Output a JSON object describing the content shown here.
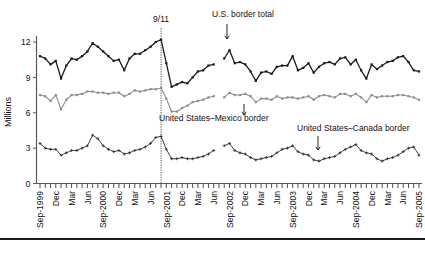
{
  "chart_data": {
    "type": "line",
    "title": "",
    "subtitle": "",
    "xlabel": "",
    "ylabel": "Millions",
    "ylim": [
      0,
      13
    ],
    "yticks": [
      0,
      3,
      6,
      9,
      12
    ],
    "ytick_labels": [
      "0",
      "3",
      "6",
      "9",
      "12"
    ],
    "grid": false,
    "legend_position": "inline-annotations",
    "x_start": "Sep-1999",
    "x_end": "Sep-2005",
    "x_interval": "monthly",
    "xtick_labels": [
      "Sep-1999",
      "Dec",
      "Mar",
      "Jun",
      "Sep-2000",
      "Dec",
      "Mar",
      "Jun",
      "Sep-2001",
      "Dec",
      "Mar",
      "Jun",
      "Sep-2002",
      "Dec",
      "Mar",
      "Jun",
      "Sep-2003",
      "Dec",
      "Mar",
      "Jun",
      "Sep-2004",
      "Dec",
      "Mar",
      "Jun",
      "Sep-2005"
    ],
    "x": [
      "Sep-1999",
      "Oct-1999",
      "Nov-1999",
      "Dec-1999",
      "Jan-2000",
      "Feb-2000",
      "Mar-2000",
      "Apr-2000",
      "May-2000",
      "Jun-2000",
      "Jul-2000",
      "Aug-2000",
      "Sep-2000",
      "Oct-2000",
      "Nov-2000",
      "Dec-2000",
      "Jan-2001",
      "Feb-2001",
      "Mar-2001",
      "Apr-2001",
      "May-2001",
      "Jun-2001",
      "Jul-2001",
      "Aug-2001",
      "Sep-2001",
      "Oct-2001",
      "Nov-2001",
      "Dec-2001",
      "Jan-2002",
      "Feb-2002",
      "Mar-2002",
      "Apr-2002",
      "May-2002",
      "Jun-2002",
      "Jul-2002",
      "Aug-2002",
      "Sep-2002",
      "Oct-2002",
      "Nov-2002",
      "Dec-2002",
      "Jan-2003",
      "Feb-2003",
      "Mar-2003",
      "Apr-2003",
      "May-2003",
      "Jun-2003",
      "Jul-2003",
      "Aug-2003",
      "Sep-2003",
      "Oct-2003",
      "Nov-2003",
      "Dec-2003",
      "Jan-2004",
      "Feb-2004",
      "Mar-2004",
      "Apr-2004",
      "May-2004",
      "Jun-2004",
      "Jul-2004",
      "Aug-2004",
      "Sep-2004",
      "Oct-2004",
      "Nov-2004",
      "Dec-2004",
      "Jan-2005",
      "Feb-2005",
      "Mar-2005",
      "Apr-2005",
      "May-2005",
      "Jun-2005",
      "Jul-2005",
      "Aug-2005",
      "Sep-2005"
    ],
    "series": [
      {
        "name": "U.S. border total",
        "color": "#1a1a1a",
        "marker": "square",
        "values": [
          10.8,
          10.6,
          10.1,
          10.4,
          8.9,
          10.0,
          10.6,
          10.5,
          10.8,
          11.2,
          11.9,
          11.6,
          11.2,
          10.8,
          10.4,
          10.5,
          9.6,
          10.6,
          11.0,
          11.0,
          11.3,
          11.6,
          12.0,
          12.2,
          10.2,
          8.2,
          8.4,
          8.6,
          8.5,
          9.0,
          9.5,
          9.6,
          10.0,
          10.1,
          null,
          10.6,
          11.3,
          10.2,
          10.3,
          10.1,
          9.5,
          8.7,
          9.4,
          9.5,
          9.3,
          9.9,
          10.0,
          10.0,
          10.8,
          9.6,
          9.8,
          10.2,
          9.4,
          9.9,
          10.2,
          10.3,
          10.1,
          10.6,
          10.7,
          10.1,
          10.5,
          9.6,
          8.9,
          10.1,
          9.7,
          10.0,
          10.3,
          10.4,
          10.7,
          10.8,
          10.3,
          9.6,
          9.5
        ]
      },
      {
        "name": "United States–Mexico border",
        "color": "#8d8d8d",
        "marker": "square",
        "values": [
          7.5,
          7.4,
          7.0,
          7.5,
          6.3,
          7.1,
          7.5,
          7.5,
          7.6,
          7.8,
          7.8,
          7.7,
          7.7,
          7.6,
          7.7,
          7.7,
          7.4,
          7.6,
          7.9,
          7.8,
          7.9,
          8.0,
          8.0,
          8.1,
          7.2,
          6.1,
          6.1,
          6.4,
          6.6,
          6.9,
          7.0,
          7.1,
          7.3,
          7.4,
          null,
          7.3,
          7.7,
          7.5,
          7.5,
          7.6,
          7.4,
          6.9,
          7.2,
          7.2,
          7.1,
          7.4,
          7.2,
          7.3,
          7.3,
          7.2,
          7.3,
          7.4,
          7.1,
          7.4,
          7.5,
          7.4,
          7.3,
          7.6,
          7.6,
          7.4,
          7.6,
          7.3,
          6.9,
          7.5,
          7.3,
          7.4,
          7.4,
          7.4,
          7.5,
          7.5,
          7.4,
          7.3,
          7.1
        ]
      },
      {
        "name": "United States–Canada border",
        "color": "#2b2b2b",
        "marker": "plus",
        "values": [
          3.4,
          3.0,
          2.9,
          2.9,
          2.4,
          2.6,
          2.8,
          2.8,
          3.0,
          3.2,
          4.1,
          3.8,
          3.2,
          2.9,
          2.7,
          2.8,
          2.5,
          2.6,
          2.8,
          2.9,
          3.1,
          3.4,
          3.9,
          4.0,
          2.9,
          2.1,
          2.1,
          2.2,
          2.1,
          2.1,
          2.2,
          2.3,
          2.5,
          2.8,
          null,
          3.2,
          3.4,
          2.8,
          2.6,
          2.5,
          2.2,
          2.0,
          2.1,
          2.2,
          2.3,
          2.6,
          2.9,
          3.0,
          3.2,
          2.7,
          2.5,
          2.4,
          2.0,
          1.9,
          2.1,
          2.2,
          2.3,
          2.6,
          2.9,
          3.1,
          3.3,
          2.8,
          2.6,
          2.5,
          2.1,
          1.9,
          2.1,
          2.2,
          2.4,
          2.7,
          3.0,
          3.1,
          2.4
        ]
      }
    ],
    "annotations": [
      {
        "name": "event-911",
        "label": "9/11",
        "x": "Aug-2001",
        "type": "vertical-dotted-line"
      },
      {
        "name": "annot-total",
        "label": "U.S. border total",
        "x": "Sep-2002",
        "y": 11.3,
        "type": "arrow-down"
      },
      {
        "name": "annot-mexico",
        "label": "United States–Mexico border",
        "x": "Mar-2003",
        "y": 7.2,
        "type": "arrow-down"
      },
      {
        "name": "annot-canada",
        "label": "United States–Canada border",
        "x": "Jan-2004",
        "y": 2.3,
        "type": "arrow-down"
      }
    ]
  }
}
